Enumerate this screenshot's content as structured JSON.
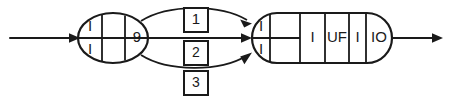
{
  "diagram": {
    "type": "state-transition-diagram",
    "background_color": "#ffffff",
    "ink_color": "#1a1a1a",
    "entry_arrow": {
      "name": "entry-arrow",
      "label": ""
    },
    "exit_arrow": {
      "name": "exit-arrow",
      "label": ""
    },
    "left_node": {
      "name": "left-state-node",
      "shape": "ellipse",
      "cells": [
        {
          "top_label": "I",
          "bottom_label": "I"
        },
        {
          "top_label": "",
          "bottom_label": ""
        },
        {
          "center_label": "9"
        }
      ]
    },
    "right_node": {
      "name": "right-state-node",
      "shape": "stadium",
      "cells": [
        {
          "top_label": "I",
          "bottom_label": "I"
        },
        {
          "center_label": ""
        },
        {
          "center_label": "I"
        },
        {
          "center_label": "UF"
        },
        {
          "center_label": "I"
        },
        {
          "center_label": "IO"
        }
      ]
    },
    "edges": [
      {
        "name": "edge-upper",
        "label": "1",
        "path": "curve-up"
      },
      {
        "name": "edge-middle",
        "label": "2",
        "path": "straight"
      },
      {
        "name": "edge-lower",
        "label": "3",
        "path": "curve-down"
      }
    ],
    "edge_labels": [
      {
        "name": "edge-label-1",
        "text": "1"
      },
      {
        "name": "edge-label-2",
        "text": "2"
      },
      {
        "name": "edge-label-3",
        "text": "3"
      }
    ]
  }
}
